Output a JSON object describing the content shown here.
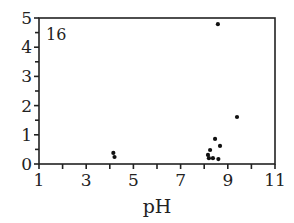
{
  "chart_data": {
    "type": "scatter",
    "title": "",
    "panel_label": "16",
    "xlabel": "pH",
    "ylabel": "",
    "xlim": [
      1,
      11
    ],
    "ylim": [
      0,
      5
    ],
    "xticks": [
      1,
      3,
      5,
      7,
      9,
      11
    ],
    "xminor_ticks": [
      1,
      2,
      3,
      4,
      5,
      6,
      7,
      8,
      9,
      10,
      11
    ],
    "yticks": [
      0,
      1,
      2,
      3,
      4,
      5
    ],
    "yminor_step": 0.5,
    "grid": false,
    "legend": null,
    "series": [
      {
        "name": "data",
        "marker": "dot",
        "color": "#111111",
        "points": [
          {
            "x": 4.15,
            "y": 0.38
          },
          {
            "x": 4.2,
            "y": 0.24
          },
          {
            "x": 8.58,
            "y": 4.79
          },
          {
            "x": 9.39,
            "y": 1.61
          },
          {
            "x": 8.46,
            "y": 0.86
          },
          {
            "x": 8.67,
            "y": 0.62
          },
          {
            "x": 8.25,
            "y": 0.48
          },
          {
            "x": 8.16,
            "y": 0.31
          },
          {
            "x": 8.2,
            "y": 0.2
          },
          {
            "x": 8.37,
            "y": 0.2
          },
          {
            "x": 8.6,
            "y": 0.17
          }
        ]
      }
    ]
  }
}
